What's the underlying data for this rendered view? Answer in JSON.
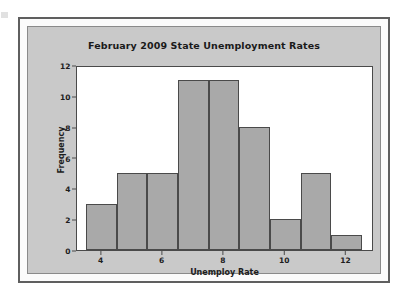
{
  "figure": {
    "background_color": "#c9c9c9",
    "plot_background_color": "#ffffff",
    "frame_color": "#5f5f5f"
  },
  "chart_data": {
    "type": "bar",
    "subtype": "histogram",
    "title": "February 2009 State Unemployment Rates",
    "xlabel": "Unemploy Rate",
    "ylabel": "Frequency",
    "bar_color": "#a9a9a9",
    "bar_edge_color": "#4a4a4a",
    "grid": false,
    "legend": null,
    "xlim": [
      3.2,
      12.9
    ],
    "ylim": [
      0,
      12
    ],
    "bin_width": 1,
    "bin_edges": [
      3.5,
      4.5,
      5.5,
      6.5,
      7.5,
      8.5,
      9.5,
      10.5,
      11.5,
      12.5
    ],
    "categories": [
      "3.5-4.5",
      "4.5-5.5",
      "5.5-6.5",
      "6.5-7.5",
      "7.5-8.5",
      "8.5-9.5",
      "9.5-10.5",
      "10.5-11.5",
      "11.5-12.5"
    ],
    "values": [
      3,
      5,
      5,
      11,
      11,
      8,
      2,
      5,
      1
    ],
    "bin_centers": [
      4,
      5,
      6,
      7,
      8,
      9,
      10,
      11,
      12
    ],
    "xticks": [
      4,
      6,
      8,
      10,
      12
    ],
    "xtick_labels": [
      "4",
      "6",
      "8",
      "10",
      "12"
    ],
    "yticks": [
      0,
      2,
      4,
      6,
      8,
      10,
      12
    ],
    "ytick_labels": [
      "0",
      "2",
      "4",
      "6",
      "8",
      "10",
      "12"
    ],
    "total_count": 51
  }
}
